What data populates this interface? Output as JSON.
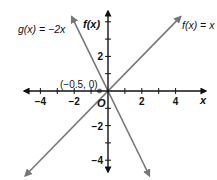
{
  "chart_data": {
    "type": "line",
    "title": "",
    "xlabel": "x",
    "ylabel": "f(x)",
    "origin_label": "O",
    "xlim": [
      -5,
      5.8
    ],
    "ylim": [
      -4.8,
      4.8
    ],
    "x_ticks": [
      -4,
      -3,
      -2,
      -1,
      1,
      2,
      3,
      4
    ],
    "x_tick_labels": [
      {
        "value": -4,
        "label": "−4"
      },
      {
        "value": -2,
        "label": "−2"
      },
      {
        "value": 2,
        "label": "2"
      },
      {
        "value": 4,
        "label": "4"
      }
    ],
    "y_ticks": [
      -4,
      -3,
      -2,
      -1,
      1,
      2,
      3,
      4
    ],
    "y_tick_labels": [
      {
        "value": 2,
        "label": "2"
      },
      {
        "value": -2,
        "label": "−2"
      },
      {
        "value": -4,
        "label": "−4"
      }
    ],
    "grid": false,
    "series": [
      {
        "name": "f(x) = x",
        "label": "f(x) = x",
        "color": "#777777",
        "slope": 1,
        "intercept": 0,
        "x_range": [
          -4.9,
          4.3
        ]
      },
      {
        "name": "g(x) = −2x",
        "label": "g(x) = −2x",
        "color": "#777777",
        "slope": -2,
        "intercept": 0,
        "x_range": [
          -2.15,
          2.45
        ]
      }
    ],
    "annotations": [
      {
        "text": "(−0.5, 0)",
        "x": -0.5,
        "y": 0,
        "marker": true,
        "marker_color": "#777777"
      }
    ],
    "axis_color": "#111111"
  }
}
